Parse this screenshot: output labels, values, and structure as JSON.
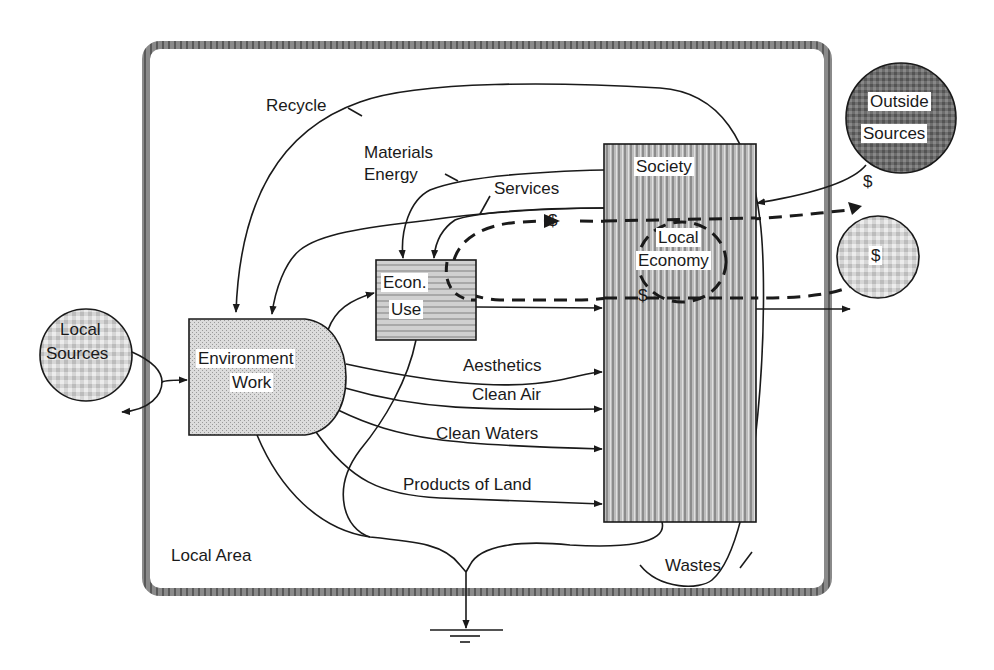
{
  "diagram": {
    "type": "energy-systems-flow-diagram",
    "boundary": {
      "label": "Local Area"
    },
    "nodes": {
      "local_sources": {
        "line1": "Local",
        "line2": "Sources"
      },
      "outside_sources": {
        "line1": "Outside",
        "line2": "Sources"
      },
      "money_source": {
        "label": "$"
      },
      "environment_work": {
        "line1": "Environment",
        "line2": "Work"
      },
      "econ_use": {
        "line1": "Econ.",
        "line2": "Use"
      },
      "society": {
        "label": "Society"
      },
      "local_economy": {
        "line1": "Local",
        "line2": "Economy"
      }
    },
    "flows": {
      "recycle": "Recycle",
      "materials": "Materials",
      "energy": "Energy",
      "services": "Services",
      "aesthetics": "Aesthetics",
      "clean_air": "Clean Air",
      "clean_waters": "Clean Waters",
      "products_of_land": "Products of Land",
      "wastes": "Wastes"
    },
    "money_labels": {
      "services_money": "$",
      "outside_money": "$",
      "local_economy_money": "$"
    },
    "colors": {
      "line": "#1a1a1a",
      "frame": "#7a7a7a",
      "outside_fill": "#6e6e6e",
      "society_fill": "#a8a8a8",
      "env_fill": "#d4d4d4",
      "econ_fill": "#c4c4c4",
      "light_fill": "#d8d8d8"
    }
  }
}
